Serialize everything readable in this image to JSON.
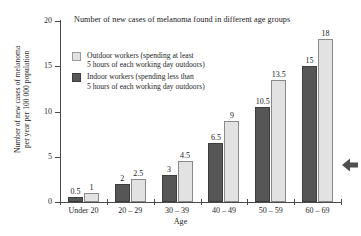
{
  "page": {
    "clipped_top_text": "",
    "background_color": "#ffffff"
  },
  "cursor": {
    "icon": "arrow-left-icon",
    "color": "#4f4f4f"
  },
  "legend": {
    "position": "inside-top-left",
    "entries": [
      {
        "key": "outdoor",
        "swatch_color": "#e2e2e2",
        "line1": "Outdoor workers (spending at least",
        "line2": "5 hours of each working day outdoors)"
      },
      {
        "key": "indoor",
        "swatch_color": "#565656",
        "line1": "Indoor workers (spending less than",
        "line2": "5 hours of each working day outdoors)"
      }
    ]
  },
  "chart_data": {
    "type": "bar",
    "title": "Number of new cases of melanoma found in different age groups",
    "xlabel": "Age",
    "ylabel": "Number of new cases of melanoma per year per 100 000 population",
    "ylabel_line1": "Number of  new cases of melanoma",
    "ylabel_line2": "per year per 100 000 population",
    "categories": [
      "Under 20",
      "20 – 29",
      "30 – 39",
      "40 – 49",
      "50 – 59",
      "60 – 69"
    ],
    "ylim": [
      0,
      20
    ],
    "yticks": [
      0,
      5,
      10,
      15,
      20
    ],
    "ytick_labels": [
      "0",
      "5",
      "10",
      "15",
      "20"
    ],
    "grid": false,
    "legend_position": "inside top-left",
    "series": [
      {
        "name": "Indoor workers (spending less than 5 hours of each working day outdoors)",
        "short_name": "Indoor workers",
        "color": "#565656",
        "values": [
          0.5,
          2,
          3,
          6.5,
          10.5,
          15
        ],
        "value_labels": [
          "0.5",
          "2",
          "3",
          "6.5",
          "10.5",
          "15"
        ]
      },
      {
        "name": "Outdoor workers (spending at least 5 hours of each working day outdoors)",
        "short_name": "Outdoor workers",
        "color": "#e2e2e2",
        "values": [
          1,
          2.5,
          4.5,
          9,
          13.5,
          18
        ],
        "value_labels": [
          "1",
          "2.5",
          "4.5",
          "9",
          "13.5",
          "18"
        ]
      }
    ]
  }
}
